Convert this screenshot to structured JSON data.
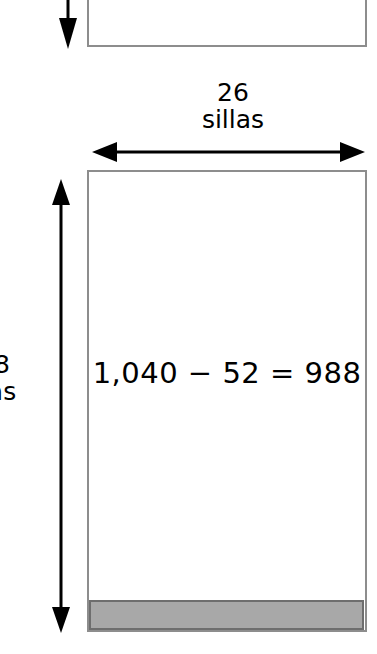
{
  "diagram": {
    "type": "area-model-rectangle-diagram",
    "language": "es",
    "width_label": {
      "value": "26",
      "unit": "sillas"
    },
    "height_label": {
      "value": "8",
      "unit": "as",
      "note": "clipped at left edge of image"
    },
    "equation": "1,040 − 52 = 988",
    "equation_parts": {
      "minuend": "1,040",
      "operator": "−",
      "subtrahend": "52",
      "equals": "=",
      "difference": "988"
    },
    "shapes": {
      "top_rectangle": "partial-rectangle-clipped-top",
      "main_rectangle": "rectangle",
      "shaded_strip": "shaded-strip-bottom"
    },
    "arrows": {
      "top_vertical": "down-arrow",
      "horizontal": "double-headed-horizontal-arrow",
      "left_vertical": "double-headed-vertical-arrow"
    },
    "colors": {
      "background": "#ffffff",
      "stroke": "#000000",
      "rectangle_border": "#8d8d8d",
      "shade_fill": "#a8a8a8",
      "shade_border": "#6e6e6e"
    }
  }
}
